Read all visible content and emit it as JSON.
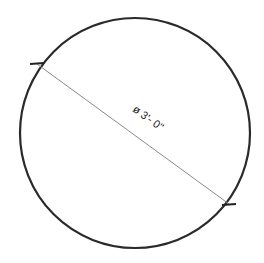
{
  "diagram": {
    "shape": "circle",
    "dimension_label": "ø 3'- 0\"",
    "stroke_color": "#2a2a2a",
    "dimension_line_color": "#888888",
    "background": "#ffffff"
  }
}
